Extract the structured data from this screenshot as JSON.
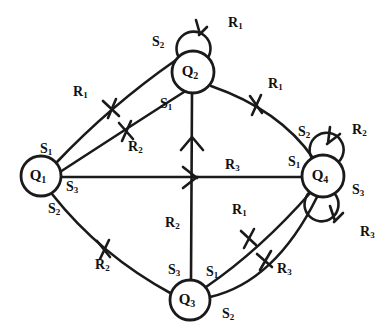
{
  "diagram": {
    "type": "finite-state-machine",
    "background_color": "#ffffff",
    "stroke_color": "#1a1a1a",
    "nodes": [
      {
        "id": "Q1",
        "base": "Q",
        "index": "1",
        "cx": 41,
        "cy": 176,
        "r": 20
      },
      {
        "id": "Q2",
        "base": "Q",
        "index": "2",
        "cx": 193,
        "cy": 72,
        "r": 21
      },
      {
        "id": "Q3",
        "base": "Q",
        "index": "3",
        "cx": 190,
        "cy": 300,
        "r": 20
      },
      {
        "id": "Q4",
        "base": "Q",
        "index": "4",
        "cx": 323,
        "cy": 176,
        "r": 21
      }
    ],
    "labels": [
      {
        "name": "label-q2-loop-s2",
        "base": "S",
        "sub": "2",
        "x": 152,
        "y": 35
      },
      {
        "name": "label-q2-loop-r1",
        "base": "R",
        "sub": "1",
        "x": 228,
        "y": 16
      },
      {
        "name": "label-q1-q2-r1",
        "base": "R",
        "sub": "1",
        "x": 73,
        "y": 85
      },
      {
        "name": "label-q2-q1-s1",
        "base": "S",
        "sub": "1",
        "x": 160,
        "y": 97
      },
      {
        "name": "label-q2-q1-r2",
        "base": "R",
        "sub": "2",
        "x": 128,
        "y": 140
      },
      {
        "name": "label-q1-up-s1",
        "base": "S",
        "sub": "1",
        "x": 40,
        "y": 142
      },
      {
        "name": "label-q1-right-s3",
        "base": "S",
        "sub": "3",
        "x": 66,
        "y": 180
      },
      {
        "name": "label-q1-down-s2",
        "base": "S",
        "sub": "2",
        "x": 48,
        "y": 202
      },
      {
        "name": "label-q2-q4-r1",
        "base": "R",
        "sub": "1",
        "x": 268,
        "y": 77
      },
      {
        "name": "label-q4-s2",
        "base": "S",
        "sub": "2",
        "x": 298,
        "y": 125
      },
      {
        "name": "label-q4-loop-r2",
        "base": "R",
        "sub": "2",
        "x": 352,
        "y": 123
      },
      {
        "name": "label-q4-left-s1",
        "base": "S",
        "sub": "1",
        "x": 288,
        "y": 155
      },
      {
        "name": "label-q4-loop-s3",
        "base": "S",
        "sub": "3",
        "x": 352,
        "y": 183
      },
      {
        "name": "label-q4-loop-r3",
        "base": "R",
        "sub": "3",
        "x": 360,
        "y": 225
      },
      {
        "name": "label-center-r3",
        "base": "R",
        "sub": "3",
        "x": 225,
        "y": 158
      },
      {
        "name": "label-center-r2",
        "base": "R",
        "sub": "2",
        "x": 165,
        "y": 216
      },
      {
        "name": "label-q3-q4-r1",
        "base": "R",
        "sub": "1",
        "x": 232,
        "y": 203
      },
      {
        "name": "label-q1-q3-r2",
        "base": "R",
        "sub": "2",
        "x": 95,
        "y": 258
      },
      {
        "name": "label-q3-left-s3",
        "base": "S",
        "sub": "3",
        "x": 168,
        "y": 263
      },
      {
        "name": "label-q3-up-s1",
        "base": "S",
        "sub": "1",
        "x": 206,
        "y": 265
      },
      {
        "name": "label-q3-q4-r3",
        "base": "R",
        "sub": "3",
        "x": 277,
        "y": 262
      },
      {
        "name": "label-q3-right-s2",
        "base": "S",
        "sub": "2",
        "x": 222,
        "y": 307
      }
    ],
    "transitions": [
      {
        "from": "Q1",
        "to": "Q2",
        "input": "S1",
        "output": "R1"
      },
      {
        "from": "Q2",
        "to": "Q1",
        "input": "S1",
        "output": "R2"
      },
      {
        "from": "Q2",
        "to": "Q2",
        "input": "S2",
        "output": "R1"
      },
      {
        "from": "Q2",
        "to": "Q4",
        "input": "S2",
        "output": "R1"
      },
      {
        "from": "Q1",
        "to": "Q4",
        "input": "S3",
        "output": "R3"
      },
      {
        "from": "Q1",
        "to": "Q3",
        "input": "S2",
        "output": "R2"
      },
      {
        "from": "Q3",
        "to": "Q2",
        "input": "S3",
        "output": "R2"
      },
      {
        "from": "Q3",
        "to": "Q4",
        "input": "S1",
        "output": "R1"
      },
      {
        "from": "Q3",
        "to": "Q4",
        "input": "S2",
        "output": "R3"
      },
      {
        "from": "Q4",
        "to": "Q4",
        "input": "S2",
        "output": "R2"
      },
      {
        "from": "Q4",
        "to": "Q4",
        "input": "S3",
        "output": "R3"
      }
    ]
  }
}
